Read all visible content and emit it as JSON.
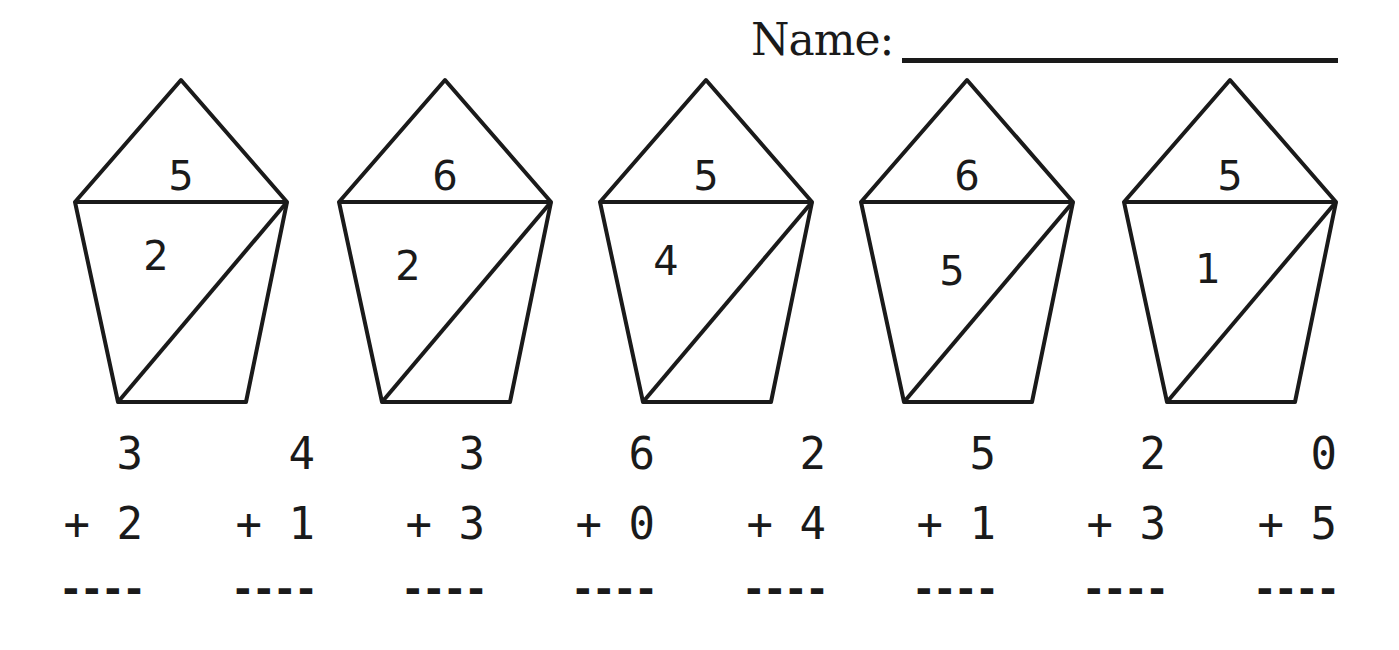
{
  "header": {
    "name_label": "Name:",
    "name_value": ""
  },
  "shapes": [
    {
      "top": "5",
      "middle": "2"
    },
    {
      "top": "6",
      "middle": "2"
    },
    {
      "top": "5",
      "middle": "4"
    },
    {
      "top": "6",
      "middle": "5"
    },
    {
      "top": "5",
      "middle": "1"
    }
  ],
  "problems": [
    {
      "a": "3",
      "b": "+ 2",
      "answer_line": "----"
    },
    {
      "a": "4",
      "b": "+ 1",
      "answer_line": "----"
    },
    {
      "a": "3",
      "b": "+ 3",
      "answer_line": "----"
    },
    {
      "a": "6",
      "b": "+ 0",
      "answer_line": "----"
    },
    {
      "a": "2",
      "b": "+ 4",
      "answer_line": "----"
    },
    {
      "a": "5",
      "b": "+ 1",
      "answer_line": "----"
    },
    {
      "a": "2",
      "b": "+ 3",
      "answer_line": "----"
    },
    {
      "a": "0",
      "b": "+ 5",
      "answer_line": "----"
    }
  ]
}
